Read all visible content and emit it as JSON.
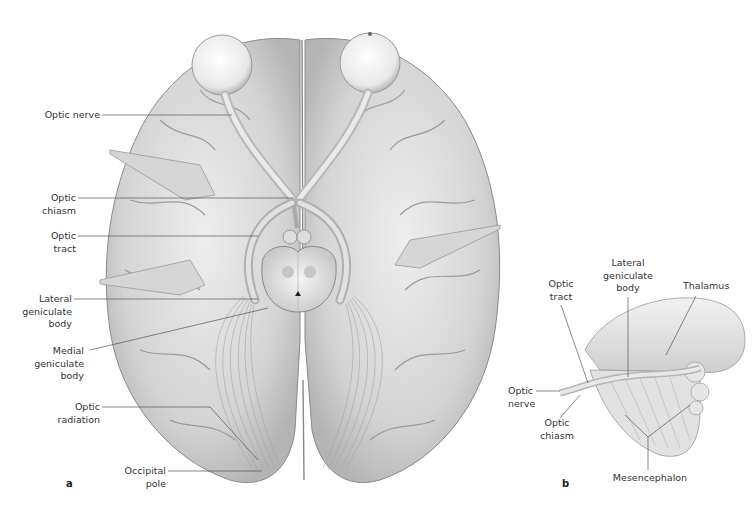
{
  "figure": {
    "panel_a": {
      "letter": "a",
      "labels": {
        "optic_nerve": "Optic nerve",
        "optic_chiasm_1": "Optic",
        "optic_chiasm_2": "chiasm",
        "optic_tract_1": "Optic",
        "optic_tract_2": "tract",
        "lateral_geniculate_1": "Lateral",
        "lateral_geniculate_2": "geniculate",
        "lateral_geniculate_3": "body",
        "medial_geniculate_1": "Medial",
        "medial_geniculate_2": "geniculate",
        "medial_geniculate_3": "body",
        "optic_radiation_1": "Optic",
        "optic_radiation_2": "radiation",
        "occipital_pole_1": "Occipital",
        "occipital_pole_2": "pole"
      }
    },
    "panel_b": {
      "letter": "b",
      "labels": {
        "optic_tract_1": "Optic",
        "optic_tract_2": "tract",
        "lateral_geniculate_1": "Lateral",
        "lateral_geniculate_2": "geniculate",
        "lateral_geniculate_3": "body",
        "thalamus": "Thalamus",
        "optic_nerve_1": "Optic",
        "optic_nerve_2": "nerve",
        "optic_chiasm_1": "Optic",
        "optic_chiasm_2": "chiasm",
        "mesencephalon": "Mesencephalon"
      }
    }
  }
}
